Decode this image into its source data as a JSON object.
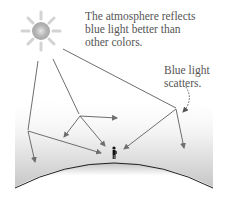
{
  "caption": {
    "lines": [
      "The atmosphere reflects",
      "blue light better than",
      "other colors."
    ]
  },
  "label": {
    "lines": [
      "Blue light",
      "scatters."
    ]
  },
  "colors": {
    "ray": "#6e6e6e",
    "horizon": "#222222",
    "sky_top": "#ffffff",
    "sky_bottom": "#c8c8c8",
    "sun_core": "#bdbdbd"
  },
  "icons": {
    "sun": "sun-icon",
    "observer": "person-icon",
    "dotted_arrow": "curved-dotted-arrow-icon"
  }
}
